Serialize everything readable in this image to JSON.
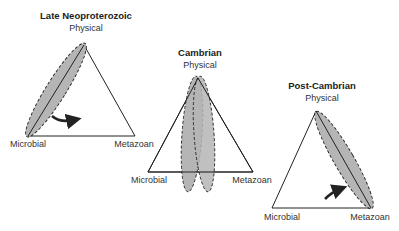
{
  "diagrams": [
    {
      "title": "Late Neoproterozoic",
      "labels": {
        "top": "Physical",
        "left": "Microbial",
        "right": "Metazoan"
      }
    },
    {
      "title": "Cambrian",
      "labels": {
        "top": "Physical",
        "left": "Microbial",
        "right": "Metazoan"
      }
    },
    {
      "title": "Post-Cambrian",
      "labels": {
        "top": "Physical",
        "left": "Microbial",
        "right": "Metazoan"
      }
    }
  ],
  "colors": {
    "ellipse_fill": "#b5b5b5",
    "line": "#222222",
    "background": "#ffffff"
  }
}
